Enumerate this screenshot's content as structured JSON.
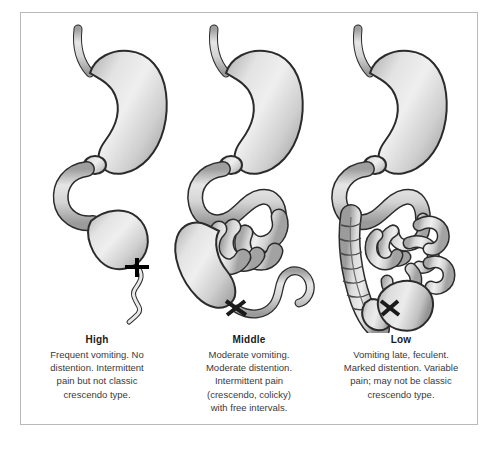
{
  "figure": {
    "panels": [
      {
        "id": "high",
        "title": "High",
        "body_lines": [
          "Frequent vomiting. No",
          "distention. Intermittent",
          "pain but not classic",
          "crescendo type."
        ],
        "obstruction_level_label": "High",
        "structures": [
          "esophagus",
          "stomach",
          "pylorus",
          "duodenum",
          "proximal-jejunum-dilated",
          "obstruction-marker",
          "collapsed-distal-bowel"
        ]
      },
      {
        "id": "middle",
        "title": "Middle",
        "body_lines": [
          "Moderate vomiting.",
          "Moderate distention.",
          "Intermittent pain",
          "(crescendo, colicky)",
          "with free intervals."
        ],
        "obstruction_level_label": "Middle",
        "structures": [
          "esophagus",
          "stomach",
          "pylorus",
          "duodenum",
          "jejunum-dilated-loops",
          "obstruction-marker",
          "collapsed-distal-bowel"
        ]
      },
      {
        "id": "low",
        "title": "Low",
        "body_lines": [
          "Vomiting late, feculent.",
          "Marked distention. Variable",
          "pain; may not be classic",
          "crescendo type."
        ],
        "obstruction_level_label": "Low",
        "structures": [
          "esophagus",
          "stomach",
          "pylorus",
          "duodenum",
          "small-bowel-dilated-loops",
          "ascending-colon-haustrated",
          "cecum",
          "sigmoid-colon",
          "obstruction-marker"
        ]
      }
    ],
    "colors": {
      "organ_fill_light": "#f2f2f2",
      "organ_fill_mid": "#d2d2d2",
      "organ_fill_dark": "#9d9d9d",
      "outline": "#2b2b2b",
      "obstruction_marker": "#000000",
      "border": "#b9b9b9",
      "background": "#ffffff",
      "title_text": "#1b1b1b",
      "body_text": "#3a3a3a"
    }
  }
}
